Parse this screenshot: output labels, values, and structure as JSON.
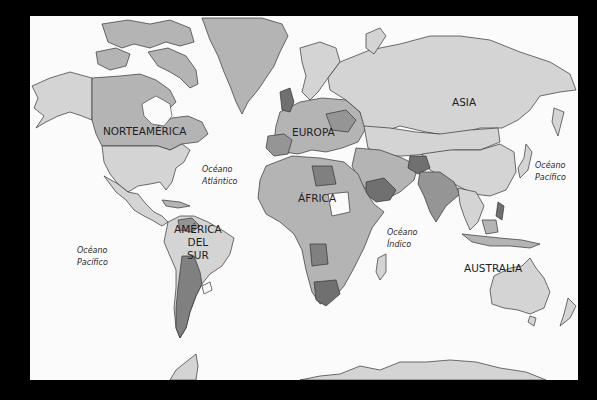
{
  "map": {
    "title": "",
    "style": "grayscale political world map",
    "colors": {
      "background": "#000000",
      "ocean": "#fbfbfb",
      "land_light": "#d4d4d4",
      "land_mid": "#b4b4b4",
      "land_darker": "#959595",
      "land_dark": "#707070",
      "outline": "#333333"
    },
    "continent_labels": {
      "north_america": "NORTEAMÉRICA",
      "europe": "EUROPA",
      "asia": "ASIA",
      "africa": "ÁFRICA",
      "south_america_line1": "AMÉRICA",
      "south_america_line2": "DEL",
      "south_america_line3": "SUR",
      "australia": "AUSTRALIA"
    },
    "ocean_labels": {
      "atlantic_line1": "Océano",
      "atlantic_line2": "Atlántico",
      "pacific_west_line1": "Océano",
      "pacific_west_line2": "Pacífico",
      "pacific_east_line1": "Océano",
      "pacific_east_line2": "Pacífico",
      "indian_line1": "Océano",
      "indian_line2": "Índico"
    }
  }
}
